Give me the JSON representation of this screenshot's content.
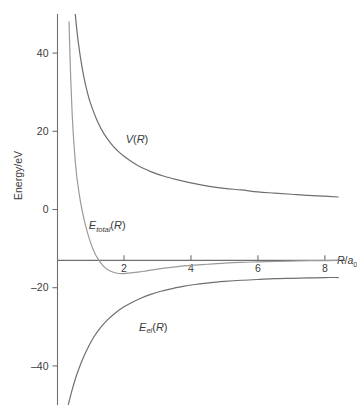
{
  "chart_data": {
    "type": "line",
    "title": "",
    "subtitle": "",
    "xlabel": "R/a0",
    "xlabel_parts": {
      "var": "R",
      "slash": "/",
      "base": "a",
      "subscript": "0"
    },
    "ylabel": "Energy/eV",
    "xlim": [
      0,
      8.6
    ],
    "ylim": [
      -50,
      50
    ],
    "x_ticks": [
      2,
      4,
      6,
      8
    ],
    "x_tick_labels": [
      "2",
      "4",
      "6",
      "8"
    ],
    "y_ticks": [
      40,
      20,
      0,
      -20,
      -40
    ],
    "y_tick_labels": [
      "40",
      "20",
      "0",
      "–20",
      "–40"
    ],
    "grid": false,
    "legend_position": "inline-annotations",
    "x_axis_line_at_y": -13,
    "series": [
      {
        "name": "V(R)",
        "label_parts": {
          "var": "V",
          "arg": "(R)"
        },
        "color": "#6f6f6f",
        "linewidth": 1.2,
        "label_x": 2.05,
        "label_y": 17,
        "x": [
          0.3,
          0.35,
          0.4,
          0.45,
          0.5,
          0.6,
          0.7,
          0.8,
          0.9,
          1.0,
          1.2,
          1.4,
          1.6,
          1.8,
          2.0,
          2.4,
          2.8,
          3.2,
          3.6,
          4.0,
          4.5,
          5.0,
          5.5,
          6.0,
          6.5,
          7.0,
          7.5,
          8.0,
          8.4
        ],
        "y": [
          90.7,
          77.8,
          68.0,
          60.5,
          54.4,
          45.3,
          38.9,
          34.0,
          30.2,
          27.2,
          22.7,
          19.4,
          17.0,
          15.1,
          13.6,
          11.3,
          9.7,
          8.5,
          7.6,
          6.8,
          6.0,
          5.4,
          5.0,
          4.5,
          4.2,
          3.9,
          3.6,
          3.4,
          3.2
        ]
      },
      {
        "name": "E_total(R)",
        "label_parts": {
          "var": "E",
          "subscript": "total",
          "arg": "(R)"
        },
        "color": "#9a9a9a",
        "linewidth": 1.2,
        "label_x": 0.95,
        "label_y": -5,
        "x": [
          0.28,
          0.32,
          0.36,
          0.4,
          0.45,
          0.5,
          0.55,
          0.6,
          0.7,
          0.8,
          0.9,
          1.0,
          1.1,
          1.2,
          1.4,
          1.6,
          1.8,
          2.0,
          2.2,
          2.4,
          2.6,
          2.8,
          3.2,
          3.6,
          4.0,
          4.5,
          5.0,
          5.5,
          6.0,
          6.5,
          7.0,
          7.5,
          8.0,
          8.4
        ],
        "y": [
          95.0,
          66.0,
          48.0,
          36.0,
          25.0,
          17.5,
          12.0,
          7.8,
          2.0,
          -2.2,
          -5.6,
          -8.4,
          -10.6,
          -12.3,
          -14.6,
          -15.8,
          -16.3,
          -16.4,
          -16.2,
          -16.0,
          -15.8,
          -15.5,
          -15.0,
          -14.6,
          -14.3,
          -14.0,
          -13.7,
          -13.5,
          -13.4,
          -13.3,
          -13.2,
          -13.1,
          -13.1,
          -13.0
        ]
      },
      {
        "name": "E_el(R)",
        "label_parts": {
          "var": "E",
          "subscript": "el",
          "arg": "(R)"
        },
        "color": "#6f6f6f",
        "linewidth": 1.2,
        "label_x": 2.45,
        "label_y": -31,
        "x": [
          0.28,
          0.35,
          0.45,
          0.55,
          0.65,
          0.8,
          0.95,
          1.1,
          1.3,
          1.5,
          1.75,
          2.0,
          2.25,
          2.5,
          2.8,
          3.1,
          3.4,
          3.8,
          4.2,
          4.6,
          5.0,
          5.5,
          6.0,
          6.5,
          7.0,
          7.5,
          8.0,
          8.4
        ],
        "y": [
          -52.0,
          -49.5,
          -46.2,
          -43.3,
          -40.8,
          -37.6,
          -34.9,
          -32.6,
          -30.2,
          -28.3,
          -26.4,
          -24.9,
          -23.7,
          -22.7,
          -21.7,
          -20.9,
          -20.3,
          -19.6,
          -19.1,
          -18.7,
          -18.4,
          -18.1,
          -17.9,
          -17.7,
          -17.6,
          -17.5,
          -17.4,
          -17.4
        ]
      }
    ]
  }
}
